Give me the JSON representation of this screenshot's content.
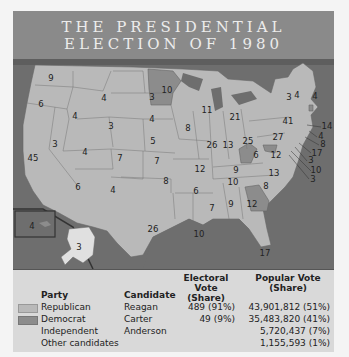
{
  "title": {
    "line1": "THE PRESIDENTIAL",
    "line2": "ELECTION OF 1980"
  },
  "colors": {
    "republican": "#b9b9b9",
    "democrat": "#8c8c8c",
    "water": "#6e6e6e",
    "title_bg": "#8a8a8a",
    "legend_bg": "#d9d9d9"
  },
  "map": {
    "states": [
      {
        "state": "WA",
        "ev": "9",
        "party": "R"
      },
      {
        "state": "OR",
        "ev": "6",
        "party": "R"
      },
      {
        "state": "CA",
        "ev": "45",
        "party": "R"
      },
      {
        "state": "ID",
        "ev": "4",
        "party": "R"
      },
      {
        "state": "NV",
        "ev": "3",
        "party": "R"
      },
      {
        "state": "MT",
        "ev": "4",
        "party": "R"
      },
      {
        "state": "WY",
        "ev": "3",
        "party": "R"
      },
      {
        "state": "UT",
        "ev": "4",
        "party": "R"
      },
      {
        "state": "CO",
        "ev": "7",
        "party": "R"
      },
      {
        "state": "AZ",
        "ev": "6",
        "party": "R"
      },
      {
        "state": "NM",
        "ev": "4",
        "party": "R"
      },
      {
        "state": "ND",
        "ev": "3",
        "party": "R"
      },
      {
        "state": "SD",
        "ev": "4",
        "party": "R"
      },
      {
        "state": "NE",
        "ev": "5",
        "party": "R"
      },
      {
        "state": "KS",
        "ev": "7",
        "party": "R"
      },
      {
        "state": "OK",
        "ev": "8",
        "party": "R"
      },
      {
        "state": "TX",
        "ev": "26",
        "party": "R"
      },
      {
        "state": "MN",
        "ev": "10",
        "party": "D"
      },
      {
        "state": "IA",
        "ev": "8",
        "party": "R"
      },
      {
        "state": "MO",
        "ev": "12",
        "party": "R"
      },
      {
        "state": "AR",
        "ev": "6",
        "party": "R"
      },
      {
        "state": "LA",
        "ev": "10",
        "party": "R"
      },
      {
        "state": "WI",
        "ev": "11",
        "party": "R"
      },
      {
        "state": "IL",
        "ev": "26",
        "party": "R"
      },
      {
        "state": "MI",
        "ev": "21",
        "party": "R"
      },
      {
        "state": "IN",
        "ev": "13",
        "party": "R"
      },
      {
        "state": "OH",
        "ev": "25",
        "party": "R"
      },
      {
        "state": "KY",
        "ev": "9",
        "party": "R"
      },
      {
        "state": "TN",
        "ev": "10",
        "party": "R"
      },
      {
        "state": "MS",
        "ev": "7",
        "party": "R"
      },
      {
        "state": "AL",
        "ev": "9",
        "party": "R"
      },
      {
        "state": "GA",
        "ev": "12",
        "party": "D"
      },
      {
        "state": "FL",
        "ev": "17",
        "party": "R"
      },
      {
        "state": "SC",
        "ev": "8",
        "party": "R"
      },
      {
        "state": "NC",
        "ev": "13",
        "party": "R"
      },
      {
        "state": "VA",
        "ev": "12",
        "party": "R"
      },
      {
        "state": "WV",
        "ev": "6",
        "party": "D"
      },
      {
        "state": "PA",
        "ev": "27",
        "party": "R"
      },
      {
        "state": "NY",
        "ev": "41",
        "party": "R"
      },
      {
        "state": "VT",
        "ev": "3",
        "party": "R"
      },
      {
        "state": "NH",
        "ev": "4",
        "party": "R"
      },
      {
        "state": "ME",
        "ev": "4",
        "party": "R"
      },
      {
        "state": "MA",
        "ev": "14",
        "party": "R"
      },
      {
        "state": "RI",
        "ev": "4",
        "party": "D"
      },
      {
        "state": "CT",
        "ev": "8",
        "party": "R"
      },
      {
        "state": "NJ",
        "ev": "17",
        "party": "R"
      },
      {
        "state": "DE",
        "ev": "3",
        "party": "R"
      },
      {
        "state": "MD",
        "ev": "10",
        "party": "D"
      },
      {
        "state": "DC",
        "ev": "3",
        "party": "D"
      },
      {
        "state": "AK",
        "ev": "3",
        "party": "R"
      },
      {
        "state": "HI",
        "ev": "4",
        "party": "D"
      }
    ]
  },
  "legend": {
    "headers": {
      "party": "Party",
      "candidate": "Candidate",
      "electoral_vote": "Electoral Vote",
      "electoral_vote_sub": "(Share)",
      "popular_vote": "Popular Vote",
      "popular_vote_sub": "(Share)"
    },
    "rows": [
      {
        "party": "Republican",
        "candidate": "Reagan",
        "electoral": "489 (91%)",
        "popular": "43,901,812 (51%)",
        "swatch": "#b9b9b9"
      },
      {
        "party": "Democrat",
        "candidate": "Carter",
        "electoral": "49 (9%)",
        "popular": "35,483,820 (41%)",
        "swatch": "#8c8c8c"
      },
      {
        "party": "Independent",
        "candidate": "Anderson",
        "electoral": "",
        "popular": "5,720,437 (7%)",
        "swatch": ""
      },
      {
        "party": "Other candidates",
        "candidate": "",
        "electoral": "",
        "popular": "1,155,593 (1%)",
        "swatch": ""
      }
    ]
  }
}
